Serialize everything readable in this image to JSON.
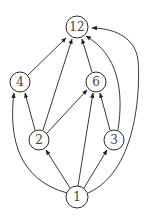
{
  "diagram": {
    "type": "directed-graph",
    "nodes": [
      {
        "id": "n12",
        "label": "12",
        "x": 77,
        "y": 27,
        "r": 11
      },
      {
        "id": "n4",
        "label": "4",
        "x": 20,
        "y": 82,
        "r": 10
      },
      {
        "id": "n6",
        "label": "6",
        "x": 96,
        "y": 82,
        "r": 10
      },
      {
        "id": "n2",
        "label": "2",
        "x": 39,
        "y": 140,
        "r": 10
      },
      {
        "id": "n3",
        "label": "3",
        "x": 114,
        "y": 140,
        "r": 10
      },
      {
        "id": "n1",
        "label": "1",
        "x": 77,
        "y": 197,
        "r": 11
      }
    ],
    "edges": [
      {
        "from": "1",
        "to": "2"
      },
      {
        "from": "1",
        "to": "3"
      },
      {
        "from": "1",
        "to": "4"
      },
      {
        "from": "1",
        "to": "6"
      },
      {
        "from": "1",
        "to": "12"
      },
      {
        "from": "2",
        "to": "4"
      },
      {
        "from": "2",
        "to": "6"
      },
      {
        "from": "2",
        "to": "12"
      },
      {
        "from": "3",
        "to": "6"
      },
      {
        "from": "3",
        "to": "12"
      },
      {
        "from": "4",
        "to": "12"
      },
      {
        "from": "6",
        "to": "12"
      }
    ],
    "colors": {
      "stroke": "#222222",
      "label": "#444444",
      "background": "#ffffff"
    }
  }
}
